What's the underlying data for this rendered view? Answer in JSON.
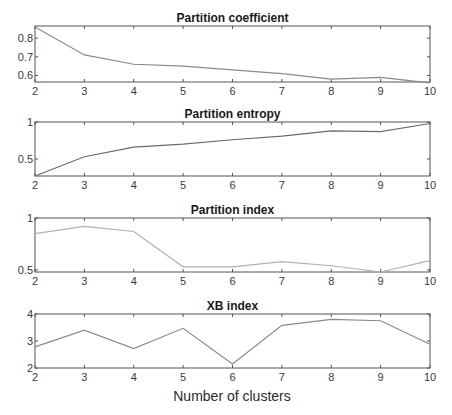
{
  "figure": {
    "xlabel": "Number of clusters"
  },
  "chart_data": [
    {
      "type": "line",
      "title": "Partition coefficient",
      "x": [
        2,
        3,
        4,
        5,
        6,
        7,
        8,
        9,
        10
      ],
      "values": [
        0.86,
        0.71,
        0.66,
        0.65,
        0.63,
        0.61,
        0.58,
        0.59,
        0.56
      ],
      "xlabel": "",
      "ylabel": "",
      "xlim": [
        2,
        10
      ],
      "ylim": [
        0.565,
        0.865
      ],
      "xticks": [
        "2",
        "3",
        "4",
        "5",
        "6",
        "7",
        "8",
        "9",
        "10"
      ],
      "yticks": [
        0.6,
        0.7,
        0.8
      ],
      "ytick_labels": [
        "0.6",
        "0.7",
        "0.8"
      ],
      "grid": false,
      "line_color": "#8a8a8a"
    },
    {
      "type": "line",
      "title": "Partition entropy",
      "x": [
        2,
        3,
        4,
        5,
        6,
        7,
        8,
        9,
        10
      ],
      "values": [
        0.27,
        0.53,
        0.66,
        0.7,
        0.76,
        0.81,
        0.88,
        0.87,
        0.98
      ],
      "xlabel": "",
      "ylabel": "",
      "xlim": [
        2,
        10
      ],
      "ylim": [
        0.27,
        1.0
      ],
      "xticks": [
        "2",
        "3",
        "4",
        "5",
        "6",
        "7",
        "8",
        "9",
        "10"
      ],
      "yticks": [
        0.5,
        1
      ],
      "ytick_labels": [
        "0.5",
        "1"
      ],
      "grid": false,
      "line_color": "#6a6a6a"
    },
    {
      "type": "line",
      "title": "Partition index",
      "x": [
        2,
        3,
        4,
        5,
        6,
        7,
        8,
        9,
        10
      ],
      "values": [
        0.85,
        0.92,
        0.87,
        0.53,
        0.53,
        0.58,
        0.54,
        0.48,
        0.59
      ],
      "xlabel": "",
      "ylabel": "",
      "xlim": [
        2,
        10
      ],
      "ylim": [
        0.48,
        1.0
      ],
      "xticks": [
        "2",
        "3",
        "4",
        "5",
        "6",
        "7",
        "8",
        "9",
        "10"
      ],
      "yticks": [
        0.5,
        1
      ],
      "ytick_labels": [
        "0.5",
        "1"
      ],
      "grid": false,
      "line_color": "#b0b0b0"
    },
    {
      "type": "line",
      "title": "XB index",
      "x": [
        2,
        3,
        4,
        5,
        6,
        7,
        8,
        9,
        10
      ],
      "values": [
        2.78,
        3.4,
        2.72,
        3.47,
        2.15,
        3.58,
        3.8,
        3.75,
        2.88
      ],
      "xlabel": "Number of clusters",
      "ylabel": "",
      "xlim": [
        2,
        10
      ],
      "ylim": [
        2,
        4
      ],
      "xticks": [
        "2",
        "3",
        "4",
        "5",
        "6",
        "7",
        "8",
        "9",
        "10"
      ],
      "yticks": [
        2,
        3,
        4
      ],
      "ytick_labels": [
        "2",
        "3",
        "4"
      ],
      "grid": false,
      "line_color": "#8a8a8a"
    }
  ]
}
